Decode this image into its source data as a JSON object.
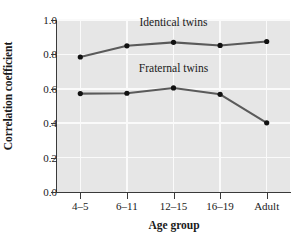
{
  "chart_data": {
    "type": "line",
    "title": "",
    "xlabel": "Age group",
    "ylabel": "Correlation coefficient",
    "categories": [
      "4–5",
      "6–11",
      "12–15",
      "16–19",
      "Adult"
    ],
    "ylim": [
      0.0,
      1.0
    ],
    "yticks": [
      "0.0",
      "0.2",
      "0.4",
      "0.6",
      "0.8",
      "1.0"
    ],
    "ytick_values": [
      0.0,
      0.2,
      0.4,
      0.6,
      0.8,
      1.0
    ],
    "grid": true,
    "legend_position": "inline-annotations",
    "series": [
      {
        "name": "Identical twins",
        "values": [
          0.785,
          0.85,
          0.87,
          0.852,
          0.875
        ],
        "color": "#5a5a5a",
        "marker_color": "#111111"
      },
      {
        "name": "Fraternal twins",
        "values": [
          0.572,
          0.574,
          0.605,
          0.568,
          0.402
        ],
        "color": "#5a5a5a",
        "marker_color": "#111111"
      }
    ],
    "annotations": [
      {
        "text": "Identical twins",
        "series": "Identical twins"
      },
      {
        "text": "Fraternal twins",
        "series": "Fraternal twins"
      }
    ],
    "plot_background": "#e6e6e6",
    "gridline_color": "#fafafa",
    "axis_color": "#3a3a3a"
  }
}
